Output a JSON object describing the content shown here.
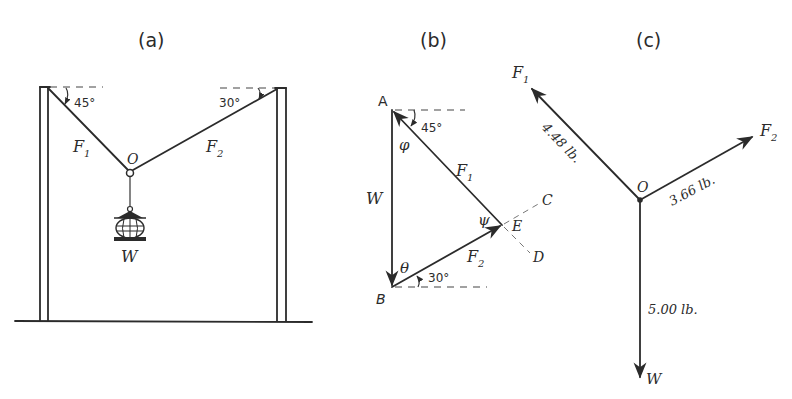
{
  "panels": {
    "a": {
      "title": "(a)",
      "labels": {
        "f1": "F",
        "f1_sub": "1",
        "f2": "F",
        "f2_sub": "2",
        "origin": "O",
        "weight": "W"
      },
      "angles": {
        "left": "45°",
        "right": "30°"
      }
    },
    "b": {
      "title": "(b)",
      "points": {
        "a": "A",
        "b": "B",
        "c": "C",
        "d": "D",
        "e": "E"
      },
      "labels": {
        "w": "W",
        "f1": "F",
        "f1_sub": "1",
        "f2": "F",
        "f2_sub": "2"
      },
      "greek": {
        "phi": "φ",
        "theta": "θ",
        "psi": "ψ"
      },
      "angles": {
        "top": "45°",
        "bottom": "30°"
      }
    },
    "c": {
      "title": "(c)",
      "labels": {
        "f1": "F",
        "f1_sub": "1",
        "f2": "F",
        "f2_sub": "2",
        "origin": "O",
        "w": "W"
      },
      "magnitudes": {
        "f1": "4.48 lb.",
        "f2": "3.66 lb.",
        "w": "5.00 lb."
      }
    }
  },
  "colors": {
    "ink": "#2b2b2b",
    "background": "#ffffff"
  }
}
